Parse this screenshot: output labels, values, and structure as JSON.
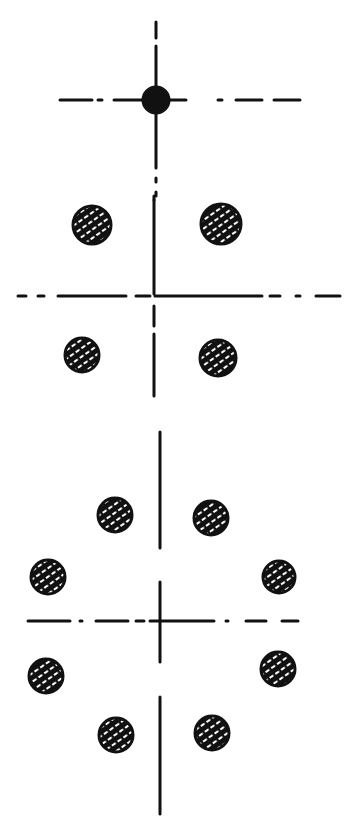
{
  "canvas": {
    "width": 355,
    "height": 837,
    "background": "#ffffff",
    "ink": "#111111"
  },
  "figures": [
    {
      "id": "single-dot",
      "center": [
        156,
        100
      ],
      "axis_h": {
        "x1": 60,
        "x2": 300,
        "dashes": [
          [
            60,
            92
          ],
          [
            98,
            102
          ],
          [
            114,
            150
          ],
          [
            162,
            186
          ],
          [
            218,
            222
          ],
          [
            236,
            262
          ],
          [
            274,
            300
          ]
        ]
      },
      "axis_v": {
        "y1": 22,
        "y2": 196,
        "dashes": [
          [
            22,
            38
          ],
          [
            46,
            92
          ],
          [
            110,
            168
          ],
          [
            178,
            182
          ],
          [
            192,
            196
          ]
        ]
      },
      "dots": [
        {
          "cx": 156,
          "cy": 100,
          "r": 13,
          "style": "solid"
        }
      ]
    },
    {
      "id": "four-dots",
      "center": [
        154,
        296
      ],
      "axis_h": {
        "x1": 18,
        "x2": 340,
        "dashes": [
          [
            18,
            26
          ],
          [
            38,
            44
          ],
          [
            58,
            126
          ],
          [
            136,
            150
          ],
          [
            155,
            262
          ],
          [
            270,
            280
          ],
          [
            296,
            300
          ],
          [
            316,
            340
          ]
        ]
      },
      "axis_v": {
        "y1": 196,
        "y2": 396,
        "dashes": [
          [
            196,
            200
          ],
          [
            200,
            294
          ],
          [
            306,
            326
          ],
          [
            334,
            396
          ]
        ]
      },
      "dots": [
        {
          "cx": 92,
          "cy": 225,
          "r": 19,
          "style": "hatched"
        },
        {
          "cx": 221,
          "cy": 224,
          "r": 20,
          "style": "hatched"
        },
        {
          "cx": 82,
          "cy": 355,
          "r": 17,
          "style": "hatched"
        },
        {
          "cx": 218,
          "cy": 358,
          "r": 18,
          "style": "hatched"
        }
      ]
    },
    {
      "id": "eight-dots",
      "center": [
        160,
        621
      ],
      "axis_h": {
        "x1": 28,
        "x2": 298,
        "dashes": [
          [
            28,
            70
          ],
          [
            80,
            82
          ],
          [
            96,
            128
          ],
          [
            136,
            144
          ],
          [
            150,
            214
          ],
          [
            226,
            228
          ],
          [
            246,
            266
          ],
          [
            282,
            298
          ]
        ]
      },
      "axis_v": {
        "y1": 432,
        "y2": 814,
        "dashes": [
          [
            432,
            548
          ],
          [
            582,
            662
          ],
          [
            697,
            814
          ]
        ]
      },
      "dots": [
        {
          "cx": 115,
          "cy": 515,
          "r": 17,
          "style": "hatched"
        },
        {
          "cx": 211,
          "cy": 518,
          "r": 17,
          "style": "hatched"
        },
        {
          "cx": 48,
          "cy": 577,
          "r": 17,
          "style": "hatched"
        },
        {
          "cx": 279,
          "cy": 577,
          "r": 16,
          "style": "hatched"
        },
        {
          "cx": 46,
          "cy": 676,
          "r": 17,
          "style": "hatched"
        },
        {
          "cx": 278,
          "cy": 669,
          "r": 17,
          "style": "hatched"
        },
        {
          "cx": 116,
          "cy": 735,
          "r": 17,
          "style": "hatched"
        },
        {
          "cx": 212,
          "cy": 733,
          "r": 17,
          "style": "hatched"
        }
      ]
    }
  ]
}
